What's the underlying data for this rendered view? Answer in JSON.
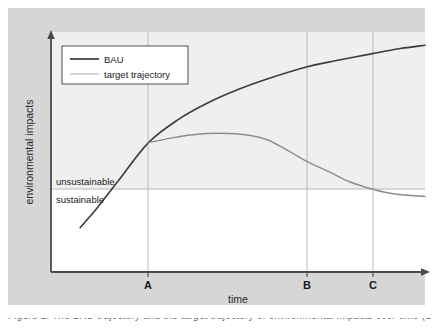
{
  "figure": {
    "background_color": "#d6d6d6",
    "plot_background_color": "#ffffff",
    "plot_upper_tint_color": "#f0f0f0",
    "caption": "Figure 1. The BAU trajectory and the target trajectory of environmental impacts over time (Source: 2014)."
  },
  "chart_data": {
    "type": "line",
    "title": "",
    "subtitle": "",
    "xlabel": "time",
    "ylabel": "environmental impacts",
    "xlim": [
      0,
      100
    ],
    "ylim": [
      0,
      100
    ],
    "grid": "vertical gridlines at A, B and C plus one horizontal sustainability threshold line",
    "legend_position": "top-left inside plot area",
    "axis_style": "arrowed axes, no numeric tick values",
    "xticks": [
      "A",
      "B",
      "C"
    ],
    "xtick_positions": [
      26,
      68.5,
      86
    ],
    "yticks": [],
    "annotations": [
      {
        "text": "unsustainable",
        "position": "above threshold line, left edge",
        "value": 67
      },
      {
        "text": "sustainable",
        "position": "below threshold line, left edge",
        "value": 63
      }
    ],
    "threshold": {
      "label": "sustainability threshold",
      "y": 34.5,
      "color": "#b0b0b0"
    },
    "series": [
      {
        "name": "BAU",
        "color": "#3c3c3c",
        "width": 1.6,
        "x": [
          7.8,
          12,
          18,
          26,
          34,
          42,
          50,
          58,
          68.5,
          76,
          86,
          93,
          100
        ],
        "values": [
          18.5,
          26,
          38,
          53.8,
          63.5,
          70.5,
          76,
          80.5,
          85.5,
          88,
          91,
          93,
          94.5
        ]
      },
      {
        "name": "target trajectory",
        "color": "#8d8d8d",
        "width": 1.4,
        "x": [
          26,
          32,
          38,
          45,
          53,
          58,
          64,
          68.5,
          74,
          80,
          86,
          92,
          100
        ],
        "values": [
          53.8,
          55.8,
          57.2,
          57.8,
          57.0,
          55.0,
          50.0,
          46.0,
          42.0,
          37.5,
          34.5,
          32.5,
          31.5
        ]
      }
    ]
  },
  "legend": {
    "items": [
      {
        "label": "BAU",
        "color": "#3c3c3c"
      },
      {
        "label": "target trajectory",
        "color": "#8d8d8d"
      }
    ]
  },
  "axes": {
    "y_title": "environmental impacts",
    "x_title": "time",
    "tick_a": "A",
    "tick_b": "B",
    "tick_c": "C",
    "label_unsustainable": "unsustainable",
    "label_sustainable": "sustainable"
  }
}
